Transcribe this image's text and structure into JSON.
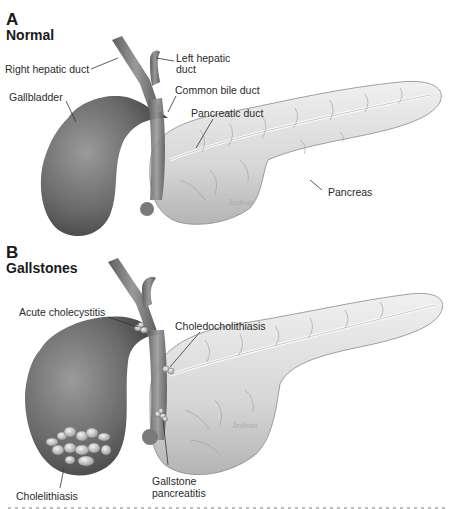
{
  "figure": {
    "panels": [
      {
        "letter": "A",
        "title": "Normal",
        "labels": {
          "right_hepatic_duct": "Right hepatic duct",
          "left_hepatic_duct_line1": "Left hepatic",
          "left_hepatic_duct_line2": "duct",
          "common_bile_duct": "Common bile duct",
          "gallbladder": "Gallbladder",
          "pancreatic_duct": "Pancreatic duct",
          "pancreas": "Pancreas"
        }
      },
      {
        "letter": "B",
        "title": "Gallstones",
        "labels": {
          "acute_cholecystitis": "Acute cholecystitis",
          "choledocholithiasis": "Choledocholithiasis",
          "cholelithiasis": "Cholelithiasis",
          "gallstone_pancreatitis_line1": "Gallstone",
          "gallstone_pancreatitis_line2": "pancreatitis"
        }
      }
    ],
    "colors": {
      "organ_dark": "#6e6e6e",
      "organ_light": "#d9d9d9",
      "label_text": "#2a2a2a"
    }
  }
}
